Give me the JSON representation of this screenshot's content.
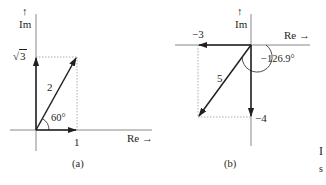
{
  "figure": {
    "panels": [
      {
        "id": "a",
        "caption": "(a)",
        "axes": {
          "imag_label": "Im",
          "imag_arrow": "↑",
          "real_label": "Re →"
        },
        "ticks": {
          "imag_value_radical": "√",
          "imag_value_radicand": "3",
          "real_value": "1"
        },
        "vector": {
          "magnitude_label": "2",
          "angle_label": "60°",
          "real": 1,
          "imag": 1.732
        }
      },
      {
        "id": "b",
        "caption": "(b)",
        "axes": {
          "imag_label": "Im",
          "imag_arrow": "↑",
          "real_label": "Re →"
        },
        "ticks": {
          "real_value": "−3",
          "imag_value": "−4"
        },
        "vector": {
          "magnitude_label": "5",
          "angle_label": "−126.9°",
          "real": -3,
          "imag": -4
        }
      }
    ],
    "cropped_text": {
      "line1": "I",
      "line2": "s"
    }
  },
  "colors": {
    "ink": "#231f20",
    "axis": "#7a7a7a",
    "dotted": "#9a9a9a"
  }
}
